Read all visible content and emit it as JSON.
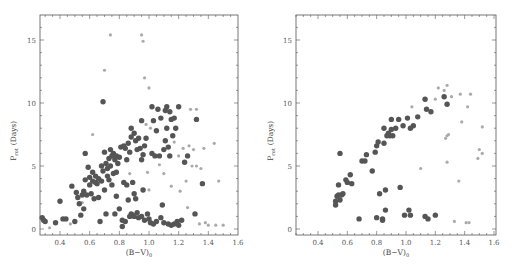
{
  "chart_data": [
    {
      "type": "scatter",
      "panel": "left",
      "title": "",
      "xlabel": "(B−V)0",
      "ylabel": "Prot (Days)",
      "xlim": [
        0.25,
        1.6
      ],
      "ylim": [
        -0.7,
        17
      ],
      "xticks": [
        "0.4",
        "0.6",
        "0.8",
        "1.0",
        "1.2",
        "1.4",
        "1.6"
      ],
      "yticks": [
        "0",
        "5",
        "10",
        "15"
      ],
      "grid": false,
      "series": [
        {
          "name": "large dark points",
          "points": [
            [
              0.28,
              0.9
            ],
            [
              0.29,
              0.7
            ],
            [
              0.3,
              0.6
            ],
            [
              0.37,
              0.5
            ],
            [
              0.4,
              2.2
            ],
            [
              0.42,
              0.8
            ],
            [
              0.44,
              0.8
            ],
            [
              0.48,
              3.4
            ],
            [
              0.5,
              0.6
            ],
            [
              0.51,
              2.9
            ],
            [
              0.52,
              2.5
            ],
            [
              0.53,
              2.0
            ],
            [
              0.54,
              1.1
            ],
            [
              0.55,
              2.7
            ],
            [
              0.56,
              1.6
            ],
            [
              0.56,
              3.0
            ],
            [
              0.57,
              6.0
            ],
            [
              0.57,
              3.9
            ],
            [
              0.58,
              2.7
            ],
            [
              0.59,
              4.9
            ],
            [
              0.6,
              4.1
            ],
            [
              0.6,
              3.5
            ],
            [
              0.61,
              2.8
            ],
            [
              0.62,
              4.5
            ],
            [
              0.62,
              3.8
            ],
            [
              0.63,
              2.4
            ],
            [
              0.64,
              3.7
            ],
            [
              0.64,
              4.2
            ],
            [
              0.65,
              3.6
            ],
            [
              0.66,
              4.0
            ],
            [
              0.66,
              2.5
            ],
            [
              0.67,
              0.6
            ],
            [
              0.68,
              3.8
            ],
            [
              0.68,
              5.0
            ],
            [
              0.69,
              10.1
            ],
            [
              0.69,
              4.6
            ],
            [
              0.7,
              6.1
            ],
            [
              0.7,
              3.1
            ],
            [
              0.71,
              5.2
            ],
            [
              0.71,
              1.2
            ],
            [
              0.72,
              4.8
            ],
            [
              0.72,
              4.2
            ],
            [
              0.73,
              5.6
            ],
            [
              0.73,
              3.9
            ],
            [
              0.74,
              5.0
            ],
            [
              0.74,
              6.3
            ],
            [
              0.75,
              5.8
            ],
            [
              0.75,
              3.5
            ],
            [
              0.76,
              6.0
            ],
            [
              0.76,
              4.4
            ],
            [
              0.77,
              5.5
            ],
            [
              0.77,
              1.2
            ],
            [
              0.78,
              5.8
            ],
            [
              0.78,
              4.5
            ],
            [
              0.78,
              2.6
            ],
            [
              0.79,
              5.2
            ],
            [
              0.8,
              5.7
            ],
            [
              0.8,
              1.6
            ],
            [
              0.81,
              6.5
            ],
            [
              0.82,
              0.7
            ],
            [
              0.82,
              0.2
            ],
            [
              0.83,
              6.6
            ],
            [
              0.83,
              3.7
            ],
            [
              0.84,
              6.4
            ],
            [
              0.84,
              0.6
            ],
            [
              0.85,
              5.5
            ],
            [
              0.85,
              3.5
            ],
            [
              0.86,
              6.8
            ],
            [
              0.86,
              2.3
            ],
            [
              0.87,
              1.0
            ],
            [
              0.87,
              6.1
            ],
            [
              0.88,
              8.0
            ],
            [
              0.88,
              7.3
            ],
            [
              0.88,
              1.2
            ],
            [
              0.89,
              3.7
            ],
            [
              0.89,
              1.1
            ],
            [
              0.9,
              7.6
            ],
            [
              0.9,
              2.8
            ],
            [
              0.9,
              1.0
            ],
            [
              0.91,
              7.0
            ],
            [
              0.91,
              2.4
            ],
            [
              0.92,
              6.3
            ],
            [
              0.92,
              1.3
            ],
            [
              0.93,
              7.2
            ],
            [
              0.93,
              0.9
            ],
            [
              0.94,
              6.4
            ],
            [
              0.95,
              8.6
            ],
            [
              0.95,
              5.5
            ],
            [
              0.95,
              1.0
            ],
            [
              0.96,
              5.9
            ],
            [
              0.96,
              3.1
            ],
            [
              0.97,
              6.6
            ],
            [
              0.97,
              0.7
            ],
            [
              0.98,
              7.2
            ],
            [
              0.99,
              1.2
            ],
            [
              1.0,
              0.8
            ],
            [
              1.01,
              0.5
            ],
            [
              1.02,
              9.7
            ],
            [
              1.02,
              6.0
            ],
            [
              1.03,
              8.6
            ],
            [
              1.03,
              0.4
            ],
            [
              1.04,
              5.8
            ],
            [
              1.05,
              7.8
            ],
            [
              1.05,
              0.6
            ],
            [
              1.06,
              9.5
            ],
            [
              1.07,
              5.8
            ],
            [
              1.08,
              8.8
            ],
            [
              1.08,
              0.9
            ],
            [
              1.09,
              1.9
            ],
            [
              1.1,
              6.3
            ],
            [
              1.1,
              0.5
            ],
            [
              1.11,
              9.4
            ],
            [
              1.11,
              7.0
            ],
            [
              1.12,
              9.7
            ],
            [
              1.12,
              8.0
            ],
            [
              1.13,
              6.5
            ],
            [
              1.13,
              0.4
            ],
            [
              1.14,
              9.3
            ],
            [
              1.14,
              5.8
            ],
            [
              1.15,
              8.7
            ],
            [
              1.15,
              0.3
            ],
            [
              1.16,
              7.4
            ],
            [
              1.17,
              8.8
            ],
            [
              1.17,
              0.4
            ],
            [
              1.18,
              8.0
            ],
            [
              1.19,
              0.6
            ],
            [
              1.2,
              9.7
            ],
            [
              1.2,
              0.3
            ],
            [
              1.22,
              0.7
            ],
            [
              1.24,
              5.3
            ],
            [
              1.26,
              5.8
            ],
            [
              1.31,
              1.2
            ],
            [
              1.32,
              8.7
            ],
            [
              1.36,
              3.6
            ]
          ]
        },
        {
          "name": "small light points",
          "points": [
            [
              0.33,
              0.1
            ],
            [
              0.47,
              0.4
            ],
            [
              0.55,
              2.1
            ],
            [
              0.62,
              7.5
            ],
            [
              0.7,
              12.6
            ],
            [
              0.74,
              15.4
            ],
            [
              0.87,
              4.4
            ],
            [
              0.95,
              15.4
            ],
            [
              0.96,
              14.9
            ],
            [
              0.97,
              12.0
            ],
            [
              0.98,
              8.3
            ],
            [
              1.0,
              11.2
            ],
            [
              1.0,
              3.1
            ],
            [
              0.99,
              4.5
            ],
            [
              1.01,
              8.0
            ],
            [
              1.07,
              5.1
            ],
            [
              1.1,
              4.4
            ],
            [
              1.15,
              3.4
            ],
            [
              1.17,
              6.9
            ],
            [
              1.2,
              5.8
            ],
            [
              1.21,
              3.0
            ],
            [
              1.23,
              6.4
            ],
            [
              1.25,
              3.8
            ],
            [
              1.26,
              1.7
            ],
            [
              1.27,
              6.6
            ],
            [
              1.28,
              9.5
            ],
            [
              1.29,
              5.0
            ],
            [
              1.3,
              6.3
            ],
            [
              1.32,
              9.5
            ],
            [
              1.32,
              5.0
            ],
            [
              1.34,
              0.4
            ],
            [
              1.35,
              4.8
            ],
            [
              1.37,
              6.4
            ],
            [
              1.38,
              0.5
            ],
            [
              1.4,
              0.3
            ],
            [
              1.44,
              6.8
            ],
            [
              1.45,
              0.3
            ],
            [
              1.47,
              3.8
            ],
            [
              1.5,
              0.3
            ]
          ]
        }
      ]
    },
    {
      "type": "scatter",
      "panel": "right",
      "title": "",
      "xlabel": "(B−V)0",
      "ylabel": "Prot (Days)",
      "xlim": [
        0.25,
        1.6
      ],
      "ylim": [
        -0.7,
        17
      ],
      "xticks": [
        "0.4",
        "0.6",
        "0.8",
        "1.0",
        "1.2",
        "1.4",
        "1.6"
      ],
      "yticks": [
        "0",
        "5",
        "10",
        "15"
      ],
      "grid": false,
      "series": [
        {
          "name": "large dark points",
          "points": [
            [
              0.52,
              2.2
            ],
            [
              0.52,
              1.9
            ],
            [
              0.53,
              2.6
            ],
            [
              0.54,
              2.7
            ],
            [
              0.54,
              3.5
            ],
            [
              0.55,
              2.3
            ],
            [
              0.55,
              6.0
            ],
            [
              0.56,
              2.7
            ],
            [
              0.57,
              2.8
            ],
            [
              0.59,
              3.9
            ],
            [
              0.6,
              3.7
            ],
            [
              0.62,
              4.3
            ],
            [
              0.63,
              3.6
            ],
            [
              0.68,
              0.8
            ],
            [
              0.7,
              5.4
            ],
            [
              0.72,
              5.4
            ],
            [
              0.73,
              5.9
            ],
            [
              0.77,
              4.6
            ],
            [
              0.79,
              6.1
            ],
            [
              0.8,
              6.6
            ],
            [
              0.8,
              0.9
            ],
            [
              0.81,
              6.9
            ],
            [
              0.82,
              2.8
            ],
            [
              0.84,
              0.8
            ],
            [
              0.84,
              0.7
            ],
            [
              0.85,
              8.0
            ],
            [
              0.85,
              6.8
            ],
            [
              0.86,
              1.5
            ],
            [
              0.86,
              3.1
            ],
            [
              0.87,
              7.4
            ],
            [
              0.88,
              7.6
            ],
            [
              0.89,
              7.4
            ],
            [
              0.9,
              8.7
            ],
            [
              0.9,
              7.9
            ],
            [
              0.91,
              7.4
            ],
            [
              0.93,
              8.0
            ],
            [
              0.95,
              8.7
            ],
            [
              0.96,
              3.3
            ],
            [
              0.98,
              8.2
            ],
            [
              0.99,
              1.1
            ],
            [
              1.01,
              8.8
            ],
            [
              1.02,
              1.5
            ],
            [
              1.03,
              8.0
            ],
            [
              1.03,
              1.1
            ],
            [
              1.05,
              8.2
            ],
            [
              1.08,
              8.9
            ],
            [
              1.13,
              10.3
            ],
            [
              1.13,
              1.0
            ],
            [
              1.14,
              9.5
            ],
            [
              1.15,
              0.8
            ],
            [
              1.17,
              9.3
            ],
            [
              1.2,
              1.1
            ],
            [
              1.26,
              10.5
            ],
            [
              1.28,
              9.9
            ]
          ]
        },
        {
          "name": "small light points",
          "points": [
            [
              1.04,
              9.7
            ],
            [
              1.1,
              4.8
            ],
            [
              1.2,
              10.3
            ],
            [
              1.22,
              11.2
            ],
            [
              1.26,
              11.0
            ],
            [
              1.27,
              7.2
            ],
            [
              1.28,
              11.4
            ],
            [
              1.28,
              7.4
            ],
            [
              1.28,
              5.3
            ],
            [
              1.29,
              7.5
            ],
            [
              1.31,
              10.5
            ],
            [
              1.33,
              0.6
            ],
            [
              1.36,
              3.8
            ],
            [
              1.37,
              10.7
            ],
            [
              1.38,
              8.5
            ],
            [
              1.41,
              0.5
            ],
            [
              1.42,
              9.7
            ],
            [
              1.43,
              0.5
            ],
            [
              1.44,
              10.7
            ],
            [
              1.49,
              5.6
            ],
            [
              1.5,
              6.3
            ],
            [
              1.52,
              6.0
            ],
            [
              1.52,
              8.1
            ]
          ]
        }
      ]
    }
  ],
  "labels": {
    "xlabel_main": "(B−V)",
    "xlabel_sub": "0",
    "ylabel_main": "P",
    "ylabel_sub": "rot",
    "ylabel_unit": "(Days)"
  }
}
